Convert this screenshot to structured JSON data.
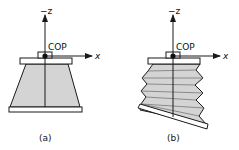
{
  "panels": [
    {
      "id": "a",
      "caption": "(a)",
      "axis_z_label": "−z",
      "axis_x_label": "x",
      "cop_label": "COP",
      "body_shape": "frustum"
    },
    {
      "id": "b",
      "caption": "(b)",
      "axis_z_label": "−z",
      "axis_x_label": "x",
      "cop_label": "COP",
      "body_shape": "sheared-bellows"
    }
  ],
  "colors": {
    "stroke": "#1a1a1a",
    "fill": "#d4d4d4",
    "plate": "#ffffff",
    "background": "#ffffff"
  }
}
